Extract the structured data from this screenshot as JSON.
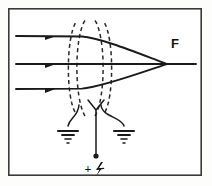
{
  "figure": {
    "background_color": "#fdfdfc",
    "ink_color": "#1a1a1a",
    "frame": {
      "name": "figure-border",
      "x": 8,
      "y": 8,
      "width": 194,
      "height": 168
    },
    "labels": {
      "focal_point": "F",
      "polarity_sign": "+",
      "high_voltage_symbol": "lightning-bolt"
    },
    "optical_axis": {
      "y": 64,
      "x_start": 16,
      "x_end": 196
    },
    "rays": [
      {
        "name": "upper-ray",
        "y": 36,
        "x_start": 16,
        "arrow_x": 48,
        "bend_x": 86,
        "focus_x": 166,
        "focus_y": 64
      },
      {
        "name": "axial-ray",
        "y": 64,
        "x_start": 16,
        "arrow_x": 48,
        "bend_x": 86,
        "focus_x": 166,
        "focus_y": 64
      },
      {
        "name": "lower-ray",
        "y": 89,
        "x_start": 16,
        "arrow_x": 48,
        "bend_x": 86,
        "focus_x": 166,
        "focus_y": 64
      }
    ],
    "field_lines": {
      "count": 4,
      "style": "dashed",
      "description": "equipotential contours of the lens field"
    },
    "electrodes": {
      "count": 3,
      "description": "three cylindrical electrode leads descending from lens region"
    },
    "grounds": [
      {
        "name": "ground-left",
        "x": 68,
        "y": 132
      },
      {
        "name": "ground-right",
        "x": 124,
        "y": 132
      }
    ],
    "hv_terminal": {
      "name": "high-voltage-terminal",
      "x": 96,
      "y": 158
    }
  }
}
